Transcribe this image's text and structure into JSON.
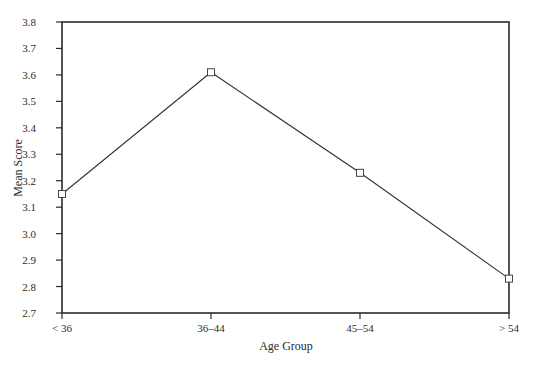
{
  "chart_data": {
    "type": "line",
    "title": "",
    "xlabel": "Age Group",
    "ylabel": "Mean Score",
    "categories": [
      "< 36",
      "36–44",
      "45–54",
      "> 54"
    ],
    "series": [
      {
        "name": "Mean Score",
        "values": [
          3.15,
          3.61,
          3.23,
          2.83
        ],
        "marker": "open-square",
        "color": "#333333"
      }
    ],
    "ylim": [
      2.7,
      3.8
    ],
    "yticks": [
      2.7,
      2.8,
      2.9,
      3.0,
      3.1,
      3.2,
      3.3,
      3.4,
      3.5,
      3.6,
      3.7,
      3.8
    ],
    "ytick_labels": [
      "2.7",
      "2.8",
      "2.9",
      "3.0",
      "3.1",
      "3.2",
      "3.3",
      "3.4",
      "3.5",
      "3.6",
      "3.7",
      "3.8"
    ],
    "grid": false,
    "legend": "none",
    "frame": "box"
  }
}
